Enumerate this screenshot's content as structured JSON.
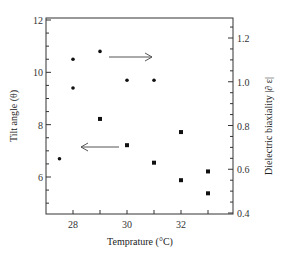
{
  "chart_data": {
    "type": "scatter",
    "title": "",
    "xlabel": "Temprature (°C)",
    "ylabel_left": "Tilt angle (θ)",
    "ylabel_right": "Dielectric biaxiality |∂ ε|",
    "xlim": [
      27,
      33.5
    ],
    "ylim_left": [
      4.6,
      12
    ],
    "ylim_right": [
      0.4,
      1.3
    ],
    "x_ticks": [
      28,
      29,
      30,
      31,
      32,
      33
    ],
    "x_tick_labels": [
      "28",
      "30",
      "32"
    ],
    "y_left_ticks": [
      6,
      8,
      10,
      12
    ],
    "y_left_tick_labels": [
      "6",
      "8",
      "10",
      "12"
    ],
    "y_right_ticks": [
      0.4,
      0.6,
      0.8,
      1.0,
      1.2
    ],
    "y_right_tick_labels": [
      "0.4",
      "0.6",
      "0.8",
      "1.0",
      "1.2"
    ],
    "grid": false,
    "legend": "none (arrows indicate axis association)",
    "annotations": [
      {
        "type": "arrow",
        "direction": "right",
        "from": [
          29.2,
          10.9
        ],
        "to": [
          30.9,
          10.9
        ],
        "meaning": "dots refer to right axis? (arrow points right)"
      },
      {
        "type": "arrow",
        "direction": "left",
        "from": [
          29.7,
          7.1
        ],
        "to": [
          28.3,
          7.1
        ],
        "meaning": "squares refer to left axis? (arrow points left)"
      }
    ],
    "series": [
      {
        "name": "Series A (round dots, upper)",
        "marker": "dot",
        "axis": "left",
        "points": [
          [
            28,
            10.5
          ],
          [
            28,
            9.4
          ],
          [
            29,
            10.8
          ],
          [
            30,
            9.7
          ],
          [
            31,
            9.7
          ],
          [
            27.5,
            6.7
          ]
        ]
      },
      {
        "name": "Series B (square markers, lower)",
        "marker": "square",
        "axis": "right",
        "points": [
          [
            29,
            0.83
          ],
          [
            30,
            0.71
          ],
          [
            31,
            0.63
          ],
          [
            32,
            0.77
          ],
          [
            32,
            0.55
          ],
          [
            33,
            0.59
          ],
          [
            33,
            0.49
          ]
        ]
      }
    ]
  },
  "labels": {
    "xlabel": "Temprature (°C)",
    "ylabel_left": "Tilt angle (θ)",
    "ylabel_right": "Dielectric biaxiality |∂ ε|"
  }
}
